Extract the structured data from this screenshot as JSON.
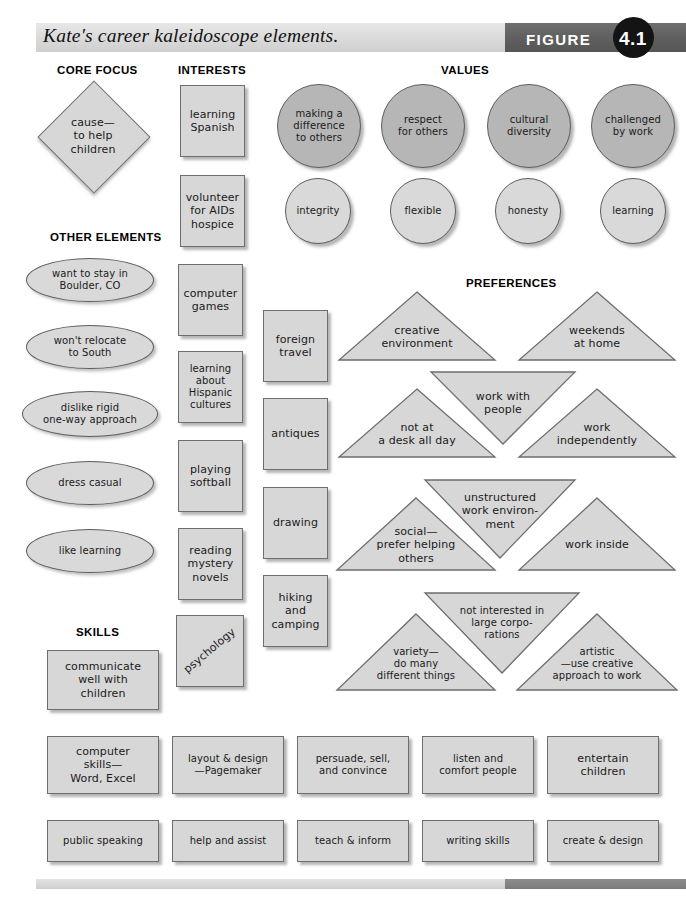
{
  "header": {
    "title": "Kate's career kaleidoscope elements.",
    "figure_label": "FIGURE",
    "figure_number": "4.1"
  },
  "sections": {
    "core_focus": "CORE FOCUS",
    "interests": "INTERESTS",
    "values": "VALUES",
    "other_elements": "OTHER ELEMENTS",
    "preferences": "PREFERENCES",
    "skills": "SKILLS"
  },
  "core_focus": {
    "shape": "diamond",
    "text": "cause—\nto help\nchildren"
  },
  "other_elements": {
    "shape": "oval",
    "items": [
      "want to stay in\nBoulder, CO",
      "won't relocate\nto South",
      "dislike rigid\none-way approach",
      "dress casual",
      "like learning"
    ]
  },
  "interests": {
    "shape": "square",
    "column_one": [
      "learning\nSpanish",
      "volunteer\nfor AIDs\nhospice",
      "computer\ngames",
      "learning\nabout\nHispanic\ncultures",
      "playing\nsoftball",
      "reading\nmystery\nnovels",
      "psychology"
    ],
    "column_two": [
      "foreign\ntravel",
      "antiques",
      "drawing",
      "hiking\nand\ncamping"
    ]
  },
  "values": {
    "shape": "circle",
    "primary": [
      "making a\ndifference\nto others",
      "respect\nfor others",
      "cultural\ndiversity",
      "challenged\nby work"
    ],
    "secondary": [
      "integrity",
      "flexible",
      "honesty",
      "learning"
    ]
  },
  "preferences": {
    "shape": "triangle",
    "items": [
      "creative\nenvironment",
      "weekends\nat home",
      "work with\npeople",
      "not at\na desk all day",
      "work\nindependently",
      "unstructured\nwork environ-\nment",
      "social—\nprefer helping\nothers",
      "work inside",
      "not interested in\nlarge corpo-\nrations",
      "variety—\ndo many\ndifferent things",
      "artistic\n—use creative\napproach to work"
    ]
  },
  "skills": {
    "shape": "rectangle",
    "featured": "communicate\nwell with\nchildren",
    "row_one": [
      "computer\nskills—\nWord, Excel",
      "layout & design\n—Pagemaker",
      "persuade, sell,\nand convince",
      "listen and\ncomfort people",
      "entertain\nchildren"
    ],
    "row_two": [
      "public speaking",
      "help and assist",
      "teach & inform",
      "writing skills",
      "create & design"
    ]
  },
  "colors": {
    "shape_fill": "#d7d7d7",
    "value_circle_dark": "#b6b6b6",
    "value_circle_light": "#d9d9d9",
    "shape_stroke": "#6e6e6e",
    "header_bar": "#dcdcdc",
    "header_bar_dark": "#606060",
    "header_dot": "#141414"
  }
}
